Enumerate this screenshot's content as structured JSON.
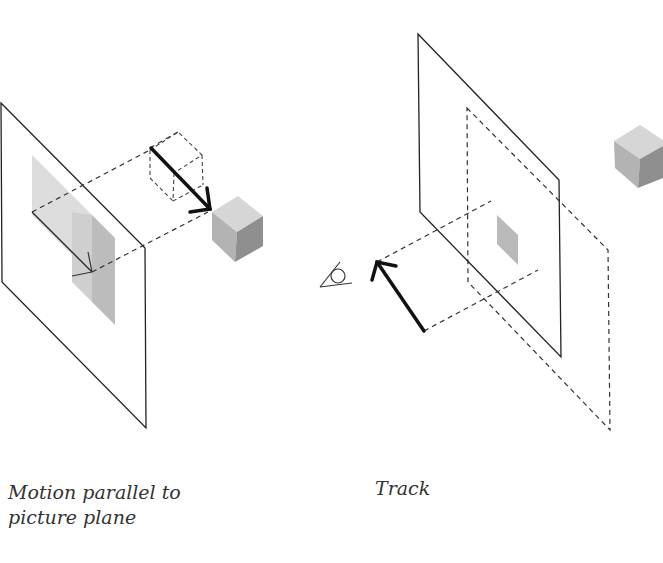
{
  "figure": {
    "panels": [
      {
        "id": "left",
        "caption_line1": "Motion parallel to",
        "caption_line2": "picture plane",
        "elements": [
          "picture-plane",
          "projected-image-smear",
          "small-arrow",
          "dashed-projection-lines",
          "dashed-ghost-cube",
          "bold-motion-arrow",
          "shaded-cube"
        ]
      },
      {
        "id": "right",
        "caption": "Track",
        "elements": [
          "picture-plane",
          "dashed-displaced-plane",
          "small-projected-square",
          "eye-icon",
          "bold-motion-arrow",
          "dashed-projection-lines",
          "shaded-cube"
        ]
      }
    ],
    "colors": {
      "line": "#222222",
      "dash": "#333333",
      "cube_top": "#d4d4d4",
      "cube_left": "#b5b5b5",
      "cube_right": "#8e8e8e",
      "smear_light": "#dcdcdc",
      "smear_dark": "#bdbdbd",
      "caption": "#333333"
    }
  }
}
